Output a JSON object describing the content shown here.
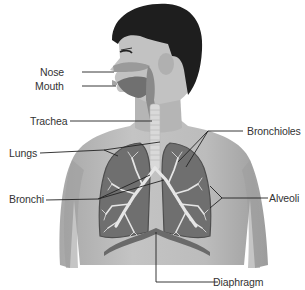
{
  "diagram": {
    "labels": [
      {
        "id": "nose",
        "text": "Nose",
        "side": "left"
      },
      {
        "id": "mouth",
        "text": "Mouth",
        "side": "left"
      },
      {
        "id": "trachea",
        "text": "Trachea",
        "side": "left"
      },
      {
        "id": "lungs",
        "text": "Lungs",
        "side": "left"
      },
      {
        "id": "bronchi",
        "text": "Bronchi",
        "side": "left"
      },
      {
        "id": "bronchioles",
        "text": "Bronchioles",
        "side": "right"
      },
      {
        "id": "alveoli",
        "text": "Alveoli",
        "side": "right"
      },
      {
        "id": "diaphragm",
        "text": "Diaphragm",
        "side": "bottom"
      }
    ],
    "colors": {
      "skin": "#bdbdbd",
      "skin_shadow": "#9a9a9a",
      "hair": "#1e1e1e",
      "lung": "#6f6f6f",
      "lung_dark": "#555555",
      "airway": "#e6e6e6",
      "leader_line": "#222222",
      "label_text": "#333333"
    }
  }
}
